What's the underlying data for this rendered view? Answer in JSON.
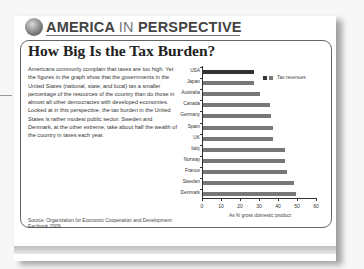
{
  "header": {
    "word1": "AMERICA",
    "word2": "IN",
    "word3": "PERSPECTIVE"
  },
  "title": "How Big Is the Tax Burden?",
  "body": "Americans commonly complain that taxes are too high. Yet the figures in the graph show that the governments in the United States (national, state, and local) tax a smaller percentage of the resources of the country than do those in almost all other democracies with developed economies. Looked at in this perspective, the tax burden in the United States is rather modest public sector. Sweden and Denmark, at the other extreme, take about half the wealth of the country in taxes each year.",
  "source": "Source: Organization for Economic Cooperation and Development Factbook 2009.",
  "colors": {
    "usa_bar": "#333333",
    "other_bar": "#777777"
  },
  "chart_data": {
    "type": "bar",
    "orientation": "horizontal",
    "title": "How Big Is the Tax Burden?",
    "xlabel": "As % gross domestic product",
    "ylabel": "",
    "xlim": [
      0,
      60
    ],
    "xticks": [
      "0",
      "10",
      "20",
      "30",
      "40",
      "50",
      "60"
    ],
    "legend": {
      "label": "Tax revenues",
      "position": "upper right"
    },
    "grid": false,
    "categories": [
      "USA",
      "Japan",
      "Australia",
      "Canada",
      "Germany",
      "Spain",
      "UK",
      "Italy",
      "Norway",
      "France",
      "Sweden",
      "Denmark"
    ],
    "series": [
      {
        "name": "Tax revenues",
        "values": [
          27,
          27,
          30,
          35,
          36,
          37,
          37,
          43,
          43,
          44,
          48,
          49
        ]
      }
    ]
  }
}
